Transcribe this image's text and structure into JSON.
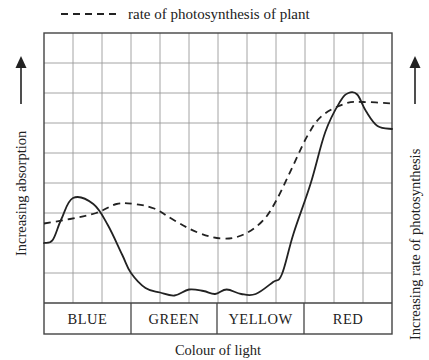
{
  "legend": {
    "label": "rate of photosynthesis of plant",
    "style": "dashed"
  },
  "axes": {
    "xlabel": "Colour of light",
    "ylabel_left": "Increasing absorption",
    "ylabel_right": "Increasing rate of photosynthesis"
  },
  "bands": [
    {
      "label": "BLUE"
    },
    {
      "label": "GREEN"
    },
    {
      "label": "YELLOW"
    },
    {
      "label": "RED"
    }
  ],
  "colors": {
    "grid": "#9a9a9a",
    "border": "#444444",
    "line": "#222222"
  },
  "chart_data": {
    "type": "line",
    "title": "",
    "xlabel": "Colour of light",
    "ylabel": "Increasing absorption",
    "ylabel_secondary": "Increasing rate of photosynthesis",
    "categories": [
      "BLUE",
      "GREEN",
      "YELLOW",
      "RED"
    ],
    "grid": true,
    "grid_columns": 12,
    "grid_rows": 9,
    "x_range": [
      0,
      12
    ],
    "ylim": [
      0,
      9
    ],
    "legend_position": "top",
    "note": "x in grid-column units (0-12, 3 columns per colour band); y in grid-row units above the band strip (0-9). No numeric tick labels in original.",
    "series": [
      {
        "name": "absorption (solid)",
        "style": "solid",
        "x": [
          0,
          0.3,
          0.6,
          1.0,
          1.7,
          2.2,
          2.7,
          3.0,
          3.5,
          4.0,
          4.5,
          5.0,
          5.5,
          5.9,
          6.3,
          6.8,
          7.3,
          7.9,
          8.2,
          8.6,
          9.2,
          9.7,
          10.2,
          10.5,
          10.8,
          11.1,
          11.5,
          12.0
        ],
        "y": [
          2.0,
          2.1,
          2.8,
          3.5,
          3.3,
          2.6,
          1.6,
          1.0,
          0.5,
          0.35,
          0.25,
          0.45,
          0.4,
          0.3,
          0.45,
          0.3,
          0.3,
          0.7,
          0.95,
          2.3,
          4.0,
          5.7,
          6.7,
          7.0,
          6.95,
          6.4,
          5.9,
          5.8
        ]
      },
      {
        "name": "rate of photosynthesis of plant (dashed)",
        "style": "dashed",
        "x": [
          0,
          0.9,
          1.8,
          2.5,
          3.1,
          3.8,
          4.5,
          5.3,
          6.1,
          6.8,
          7.5,
          8.0,
          8.6,
          9.1,
          9.6,
          10.4,
          11.0,
          12.0
        ],
        "y": [
          2.65,
          2.8,
          3.0,
          3.3,
          3.3,
          3.15,
          2.75,
          2.35,
          2.15,
          2.25,
          2.7,
          3.4,
          4.6,
          5.6,
          6.25,
          6.65,
          6.7,
          6.65
        ]
      }
    ]
  }
}
